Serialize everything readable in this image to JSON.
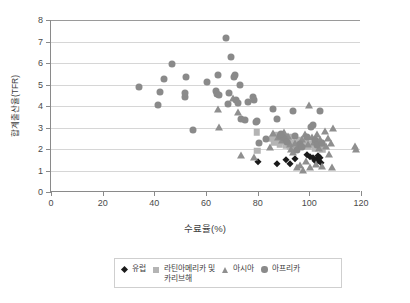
{
  "chart_data": {
    "type": "scatter",
    "title": "",
    "xlabel": "수료율(%)",
    "ylabel": "합계출산율(TFR)",
    "xlim": [
      0,
      120
    ],
    "ylim": [
      0,
      8
    ],
    "xticks": [
      0,
      20,
      40,
      60,
      80,
      100,
      120
    ],
    "yticks": [
      0,
      1,
      2,
      3,
      4,
      5,
      6,
      7,
      8
    ],
    "grid": "horizontal",
    "legend_position": "bottom",
    "series": [
      {
        "name": "유럽",
        "marker": "diamond",
        "color": "#1a1a1a",
        "points": [
          [
            80.0,
            1.38
          ],
          [
            87.6,
            1.3
          ],
          [
            91.0,
            1.48
          ],
          [
            92.4,
            1.28
          ],
          [
            94.4,
            1.55
          ],
          [
            100.4,
            1.62
          ],
          [
            101.6,
            1.58
          ],
          [
            102.6,
            1.5
          ],
          [
            103.2,
            1.66
          ],
          [
            103.4,
            1.42
          ],
          [
            104.0,
            1.56
          ],
          [
            104.6,
            1.35
          ],
          [
            99.2,
            1.72
          ],
          [
            102.0,
            1.44
          ]
        ]
      },
      {
        "name": "라틴아메리카 및\n카리브해",
        "marker": "square",
        "color": "#b4b4b4",
        "points": [
          [
            79.6,
            2.78
          ],
          [
            79.8,
            1.92
          ],
          [
            85.6,
            2.48
          ],
          [
            86.4,
            2.3
          ],
          [
            87.2,
            2.52
          ],
          [
            88.0,
            2.42
          ],
          [
            88.6,
            2.2
          ],
          [
            89.4,
            2.36
          ],
          [
            90.2,
            2.58
          ],
          [
            91.0,
            2.18
          ],
          [
            91.8,
            2.44
          ],
          [
            92.6,
            2.12
          ],
          [
            93.4,
            2.3
          ],
          [
            94.2,
            2.06
          ],
          [
            95.0,
            2.26
          ],
          [
            96.0,
            2.4
          ],
          [
            97.2,
            2.16
          ],
          [
            98.4,
            2.34
          ],
          [
            99.6,
            2.1
          ],
          [
            100.8,
            2.24
          ],
          [
            102.0,
            2.02
          ],
          [
            103.2,
            2.28
          ],
          [
            104.2,
            2.14
          ],
          [
            105.0,
            1.98
          ],
          [
            86.8,
            2.64
          ],
          [
            93.0,
            2.56
          ]
        ]
      },
      {
        "name": "아시아",
        "marker": "triangle",
        "color": "#8f8f8f",
        "points": [
          [
            64.8,
            3.86
          ],
          [
            65.2,
            3.04
          ],
          [
            70.6,
            4.36
          ],
          [
            72.2,
            3.74
          ],
          [
            73.4,
            1.7
          ],
          [
            78.4,
            1.62
          ],
          [
            88.0,
            2.56
          ],
          [
            89.4,
            2.44
          ],
          [
            90.0,
            2.78
          ],
          [
            91.6,
            2.62
          ],
          [
            92.4,
            2.24
          ],
          [
            93.0,
            2.02
          ],
          [
            93.8,
            1.86
          ],
          [
            94.6,
            2.3
          ],
          [
            95.2,
            1.14
          ],
          [
            95.8,
            2.12
          ],
          [
            96.4,
            1.26
          ],
          [
            97.0,
            2.46
          ],
          [
            97.6,
            1.02
          ],
          [
            98.2,
            2.68
          ],
          [
            98.8,
            1.44
          ],
          [
            99.4,
            2.22
          ],
          [
            100.0,
            4.06
          ],
          [
            100.2,
            1.18
          ],
          [
            101.0,
            2.58
          ],
          [
            101.8,
            2.34
          ],
          [
            102.4,
            1.32
          ],
          [
            103.0,
            2.72
          ],
          [
            103.6,
            2.04
          ],
          [
            104.2,
            2.46
          ],
          [
            104.8,
            1.22
          ],
          [
            105.4,
            2.3
          ],
          [
            106.0,
            2.86
          ],
          [
            106.6,
            2.12
          ],
          [
            107.2,
            2.52
          ],
          [
            107.8,
            1.78
          ],
          [
            108.4,
            2.26
          ],
          [
            108.8,
            1.16
          ],
          [
            109.2,
            2.96
          ],
          [
            117.8,
            2.16
          ],
          [
            118.0,
            2.02
          ],
          [
            84.6,
            2.1
          ],
          [
            86.0,
            2.74
          ]
        ]
      },
      {
        "name": "아프리카",
        "marker": "circle",
        "color": "#8a8a8a",
        "points": [
          [
            34.0,
            4.88
          ],
          [
            41.6,
            4.06
          ],
          [
            42.2,
            4.66
          ],
          [
            43.8,
            5.26
          ],
          [
            46.8,
            5.96
          ],
          [
            51.8,
            4.44
          ],
          [
            52.0,
            4.62
          ],
          [
            52.4,
            5.36
          ],
          [
            54.8,
            2.88
          ],
          [
            60.4,
            5.12
          ],
          [
            63.8,
            4.68
          ],
          [
            64.2,
            4.54
          ],
          [
            64.6,
            5.46
          ],
          [
            65.0,
            4.5
          ],
          [
            67.8,
            7.16
          ],
          [
            68.4,
            4.08
          ],
          [
            69.0,
            4.6
          ],
          [
            69.6,
            6.26
          ],
          [
            70.8,
            5.36
          ],
          [
            71.2,
            5.44
          ],
          [
            71.8,
            4.26
          ],
          [
            72.4,
            4.14
          ],
          [
            73.0,
            4.96
          ],
          [
            73.6,
            3.38
          ],
          [
            75.2,
            3.34
          ],
          [
            76.4,
            4.18
          ],
          [
            78.0,
            4.42
          ],
          [
            78.6,
            4.3
          ],
          [
            79.2,
            3.26
          ],
          [
            79.8,
            3.28
          ],
          [
            80.4,
            2.3
          ],
          [
            85.8,
            3.88
          ],
          [
            87.4,
            3.38
          ],
          [
            88.6,
            2.62
          ],
          [
            90.2,
            2.5
          ],
          [
            91.4,
            2.34
          ],
          [
            93.8,
            3.76
          ],
          [
            95.2,
            1.96
          ],
          [
            96.4,
            2.24
          ],
          [
            97.2,
            2.08
          ],
          [
            99.0,
            2.54
          ],
          [
            100.6,
            3.02
          ],
          [
            101.4,
            3.1
          ],
          [
            102.2,
            2.4
          ],
          [
            103.0,
            2.18
          ],
          [
            104.0,
            3.76
          ],
          [
            104.8,
            2.26
          ],
          [
            83.4,
            2.48
          ],
          [
            89.0,
            2.7
          ],
          [
            94.4,
            2.6
          ]
        ]
      }
    ]
  },
  "legend": {
    "items": [
      {
        "label": "유럽",
        "marker": "diamond",
        "color": "#1a1a1a"
      },
      {
        "label": "라틴아메리카 및\n카리브해",
        "marker": "square",
        "color": "#b4b4b4"
      },
      {
        "label": "아시아",
        "marker": "triangle",
        "color": "#8f8f8f"
      },
      {
        "label": "아프리카",
        "marker": "circle",
        "color": "#8a8a8a"
      }
    ]
  },
  "colors": {
    "axis": "#8a8a8a",
    "gridline": "#d6d6d6",
    "background": "#ffffff",
    "text": "#3d3d3d"
  }
}
